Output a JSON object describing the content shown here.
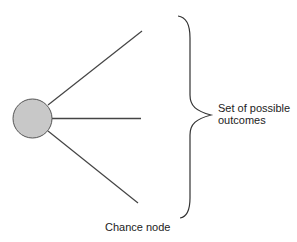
{
  "diagram": {
    "type": "decision-tree-fragment",
    "node": {
      "kind": "chance-node",
      "shape": "circle",
      "fill": "#c8c8c8",
      "stroke": "#555555",
      "label": "Chance node"
    },
    "branches": [
      {
        "id": "top"
      },
      {
        "id": "middle"
      },
      {
        "id": "bottom"
      }
    ],
    "brace": {
      "label_line1": "Set of possible",
      "label_line2": "outcomes"
    },
    "colors": {
      "line": "#444444",
      "text": "#222222",
      "background": "#ffffff"
    }
  }
}
